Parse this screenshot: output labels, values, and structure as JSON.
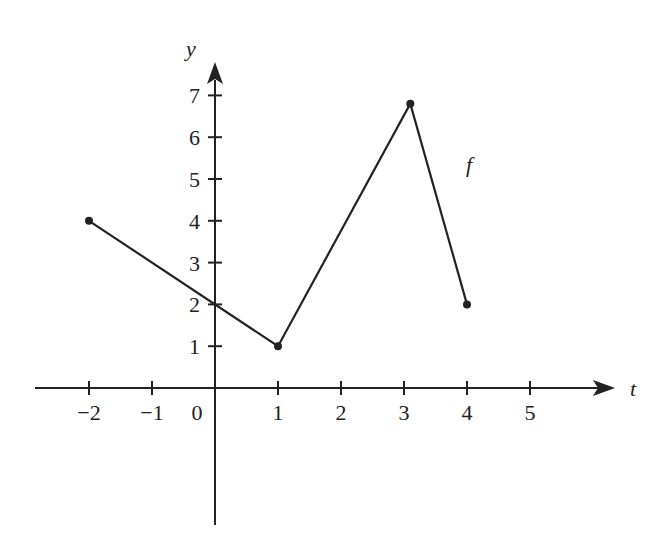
{
  "chart_data": {
    "type": "line",
    "title": "",
    "xlabel": "t",
    "ylabel": "y",
    "function_label": "f",
    "x_ticks": [
      -2,
      -1,
      0,
      1,
      2,
      3,
      4,
      5
    ],
    "x_tick_labels": [
      "−2",
      "−1",
      "0",
      "1",
      "2",
      "3",
      "4",
      "5"
    ],
    "y_ticks": [
      1,
      2,
      3,
      4,
      5,
      6,
      7
    ],
    "y_tick_labels": [
      "1",
      "2",
      "3",
      "4",
      "5",
      "6",
      "7"
    ],
    "xlim": [
      -3,
      6
    ],
    "ylim": [
      -3.3,
      8
    ],
    "grid": false,
    "legend": "none",
    "series": [
      {
        "name": "f",
        "points": [
          {
            "x": -2,
            "y": 4
          },
          {
            "x": 1,
            "y": 1
          },
          {
            "x": 3.1,
            "y": 6.8
          },
          {
            "x": 4,
            "y": 2
          }
        ]
      }
    ],
    "colors": {
      "line": "#222222",
      "axis": "#222222",
      "background": "#ffffff"
    }
  }
}
